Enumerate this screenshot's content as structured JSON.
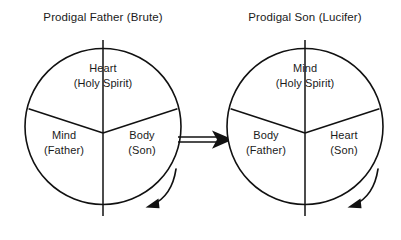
{
  "diagram": {
    "type": "two-circle-sector-comparison",
    "background_color": "#ffffff",
    "stroke_color": "#111111",
    "text_color": "#1a1a1a",
    "left": {
      "title": "Prodigal Father (Brute)",
      "sectors": {
        "top": {
          "name": "Heart",
          "qualifier": "(Holy Spirit)"
        },
        "lower_left": {
          "name": "Mind",
          "qualifier": "(Father)"
        },
        "lower_right": {
          "name": "Body",
          "qualifier": "(Son)"
        }
      },
      "rotation_arrow": "counterclockwise-sweep-below-right"
    },
    "right": {
      "title": "Prodigal Son (Lucifer)",
      "sectors": {
        "top": {
          "name": "Mind",
          "qualifier": "(Holy Spirit)"
        },
        "lower_left": {
          "name": "Body",
          "qualifier": "(Father)"
        },
        "lower_right": {
          "name": "Heart",
          "qualifier": "(Son)"
        }
      },
      "rotation_arrow": "counterclockwise-sweep-below-right"
    },
    "connector": {
      "name": "double-line-arrow",
      "direction": "left-to-right"
    }
  }
}
